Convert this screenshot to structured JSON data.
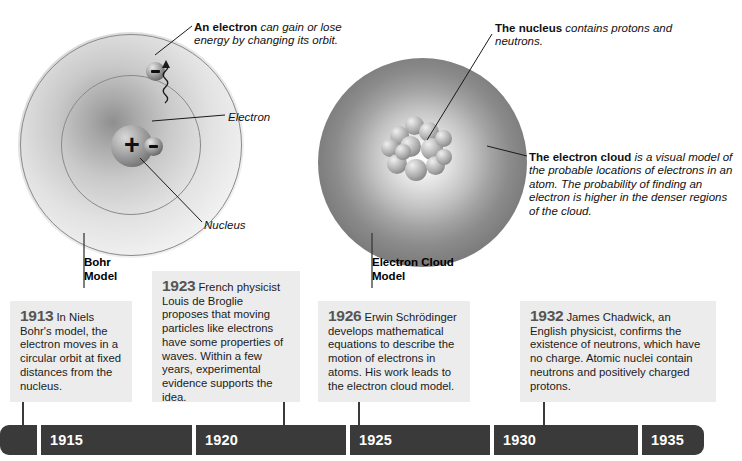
{
  "diagram": {
    "models": [
      {
        "id": "bohr",
        "title": "Bohr\nModel"
      },
      {
        "id": "cloud",
        "title": "Electron Cloud\nModel"
      }
    ],
    "callouts": {
      "electron_energy": {
        "bold": "An electron",
        "rest": " can gain or lose energy by changing its orbit."
      },
      "electron_label": {
        "bold": "",
        "rest": "Electron"
      },
      "nucleus_label": {
        "bold": "",
        "rest": "Nucleus"
      },
      "cloud_nucleus": {
        "bold": "The nucleus",
        "rest": " contains protons and neutrons."
      },
      "cloud_desc": {
        "bold": "The electron cloud",
        "rest": " is a visual model of the probable locations of electrons in an atom. The probability of finding an electron is higher in the denser regions of the cloud."
      }
    },
    "particles": {
      "nucleus_charge": "+",
      "electron_charge": "−"
    }
  },
  "timeline": {
    "events": [
      {
        "year": "1913",
        "text": " In Niels Bohr's model, the electron moves in a circular orbit at fixed distances from the nucleus."
      },
      {
        "year": "1923",
        "text": " French physicist Louis de Broglie proposes that moving particles like electrons have some properties of waves. Within a few years, experimental evidence supports the idea."
      },
      {
        "year": "1926",
        "text": " Erwin Schrödinger develops mathematical equations to describe the motion of electrons in atoms. His work leads to the electron cloud model."
      },
      {
        "year": "1932",
        "text": " James Chadwick, an English physicist, confirms the existence of neutrons, which have no charge. Atomic nuclei contain neutrons and positively charged protons."
      }
    ],
    "axis_labels": [
      "1915",
      "1920",
      "1925",
      "1930",
      "1935"
    ],
    "bar_color": "#3a3a3a",
    "box_color": "#ececec",
    "year_color": "#555555"
  }
}
